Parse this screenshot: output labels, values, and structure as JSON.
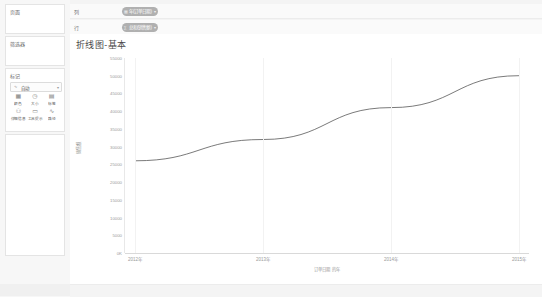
{
  "app": {
    "product": "Tableau",
    "accent": "#b0b0b0",
    "line_color": "#6b6b6b"
  },
  "left_rail": {
    "data_pane": {
      "title": "页面"
    },
    "analytics_pane": {
      "title": "筛选器"
    },
    "marks_card": {
      "title": "标记",
      "mark_type": "自动",
      "mark_type_icon": "line-icon",
      "dropdown_arrow": "▾",
      "buttons": [
        {
          "label": "颜色",
          "icon": "color-icon",
          "glyph": "▦"
        },
        {
          "label": "大小",
          "icon": "size-icon",
          "glyph": "◷"
        },
        {
          "label": "标签",
          "icon": "label-icon",
          "glyph": "▤"
        },
        {
          "label": "详细信息",
          "icon": "detail-icon",
          "glyph": "⚇"
        },
        {
          "label": "工具提示",
          "icon": "tooltip-icon",
          "glyph": "▭"
        },
        {
          "label": "路径",
          "icon": "path-icon",
          "glyph": "∿"
        }
      ]
    }
  },
  "shelves": [
    {
      "name": "columns-shelf",
      "label": "列",
      "pill": {
        "text": "年(订单日期)",
        "icon": "calendar-icon",
        "arrow": "▾"
      }
    },
    {
      "name": "rows-shelf",
      "label": "行",
      "pill": {
        "text": "总和(销售额)",
        "icon": "sum-icon",
        "arrow": "▾"
      }
    }
  ],
  "view": {
    "title": "折线图-基本"
  },
  "chart_data": {
    "type": "line",
    "title": "折线图-基本",
    "xlabel": "订单日期 的年",
    "ylabel": "销售额",
    "categories": [
      "2012年",
      "2013年",
      "2014年",
      "2015年"
    ],
    "values": [
      26000,
      32000,
      41000,
      50000
    ],
    "ylim": [
      0,
      55000
    ],
    "yticks": [
      0,
      5000,
      10000,
      15000,
      20000,
      25000,
      30000,
      35000,
      40000,
      45000,
      50000,
      55000
    ],
    "ytick_labels": [
      "0K",
      "5000",
      "10000",
      "15000",
      "20000",
      "25000",
      "30000",
      "35000",
      "40000",
      "45000",
      "50000",
      "55000"
    ],
    "grid": false,
    "legend": "none",
    "series": [
      {
        "name": "总和(销售额)",
        "values": [
          26000,
          32000,
          41000,
          50000
        ]
      }
    ]
  }
}
